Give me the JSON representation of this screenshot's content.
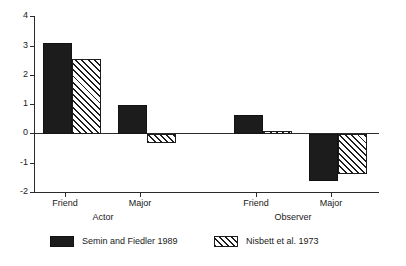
{
  "chart_data": {
    "type": "bar",
    "title": "",
    "subtitle": "",
    "xlabel": "",
    "ylabel": "",
    "ylim": [
      -2,
      4
    ],
    "yticks": [
      4,
      3,
      2,
      1,
      0,
      -1,
      -2
    ],
    "ytick_labels": [
      "4",
      "3",
      "2",
      "1",
      "0",
      "-1",
      "-2"
    ],
    "grid": false,
    "legend_position": "bottom-left",
    "groups": [
      {
        "name": "Actor",
        "categories": [
          "Friend",
          "Major"
        ]
      },
      {
        "name": "Observer",
        "categories": [
          "Friend",
          "Major"
        ]
      }
    ],
    "categories": [
      "Friend",
      "Major",
      "Friend",
      "Major"
    ],
    "series": [
      {
        "name": "Semin and Fiedler 1989",
        "style": "solid",
        "color": "#1c1c1c",
        "values": [
          3.1,
          1.0,
          0.65,
          -1.6
        ]
      },
      {
        "name": "Nisbett et al. 1973",
        "style": "hatched",
        "color": "#ffffff",
        "values": [
          2.55,
          -0.3,
          0.1,
          -1.35
        ]
      }
    ]
  },
  "axis": {
    "y_labels": [
      "4",
      "3",
      "2",
      "1",
      "0",
      "-1",
      "-2"
    ],
    "x_labels": [
      "Friend",
      "Major",
      "Friend",
      "Major"
    ],
    "group_labels": [
      "Actor",
      "Observer"
    ]
  },
  "legend": {
    "entries": [
      {
        "label": "Semin and Fiedler 1989",
        "style": "solid"
      },
      {
        "label": "Nisbett et al. 1973",
        "style": "hatched"
      }
    ]
  },
  "colors": {
    "solid_fill": "#1c1c1c",
    "hatch_stroke": "#1c1c1c",
    "axis": "#2b2b2b",
    "background": "#ffffff"
  }
}
